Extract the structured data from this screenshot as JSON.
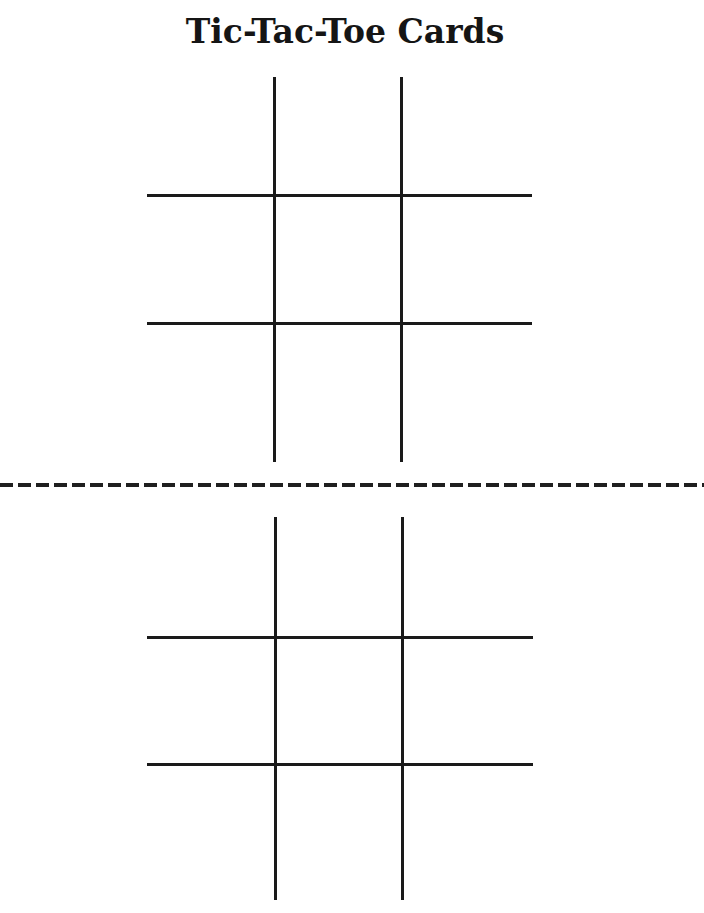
{
  "page": {
    "title": "Tic-Tac-Toe Cards"
  },
  "cards": [
    {
      "name": "card-top",
      "rows": 3,
      "cols": 3
    },
    {
      "name": "card-bottom",
      "rows": 3,
      "cols": 3
    }
  ],
  "colors": {
    "ink": "#1a1a1a",
    "background": "#ffffff"
  }
}
